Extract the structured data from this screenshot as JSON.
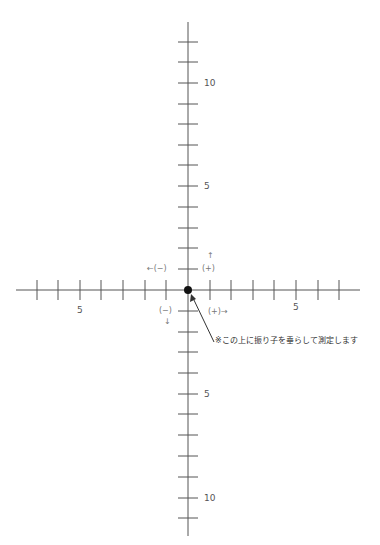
{
  "diagram": {
    "title": "",
    "origin": {
      "x": 188,
      "y": 290
    },
    "axes": {
      "horizontal": {
        "x_start": 16,
        "x_end": 360,
        "y": 290,
        "ticks_left": [
          37,
          58,
          80,
          101,
          123,
          145,
          166
        ],
        "ticks_right": [
          210,
          231,
          253,
          274,
          296,
          318,
          339
        ]
      },
      "vertical": {
        "x": 188,
        "y_start": 22,
        "y_end": 536,
        "ticks_top": [
          42,
          62,
          83,
          104,
          124,
          145,
          165,
          186,
          207,
          228,
          248,
          269
        ],
        "ticks_bottom": [
          311,
          332,
          352,
          373,
          394,
          414,
          435,
          456,
          477,
          498,
          518
        ]
      }
    },
    "labels": {
      "up_10": "10",
      "up_5": "5",
      "down_5": "5",
      "down_10": "10",
      "left_5": "5",
      "right_5": "5"
    },
    "direction_labels": {
      "up_arrow": "↑",
      "up_plus": "(+)",
      "left_minus": "←(−)",
      "down_minus": "(−)",
      "down_arrow": "↓",
      "right_plus": "(+)→"
    },
    "annotation": "※この上に振り子を垂らして測定します",
    "colors": {
      "axis": "#555555",
      "dot": "#111111",
      "background": "#ffffff"
    }
  }
}
